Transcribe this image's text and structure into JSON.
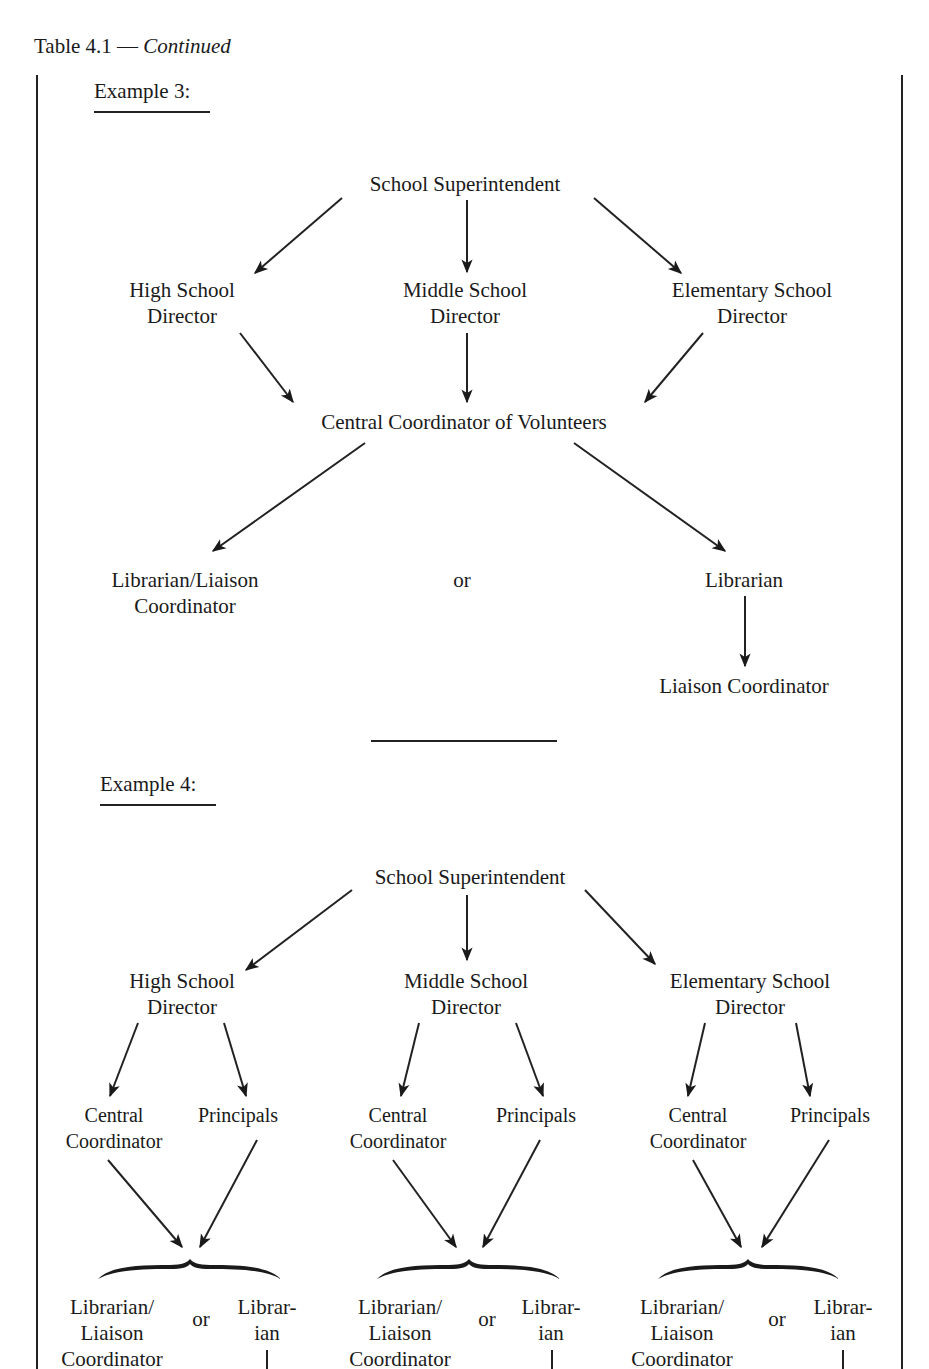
{
  "caption": {
    "prefix": "Table 4.1 — ",
    "italic": "Continued"
  },
  "example3": {
    "heading": "Example 3:",
    "superintendent": "School Superintendent",
    "directors": [
      {
        "line1": "High School",
        "line2": "Director"
      },
      {
        "line1": "Middle School",
        "line2": "Director"
      },
      {
        "line1": "Elementary School",
        "line2": "Director"
      }
    ],
    "central": "Central Coordinator of Volunteers",
    "option_a": {
      "line1": "Librarian/Liaison",
      "line2": "Coordinator"
    },
    "or": "or",
    "option_b": {
      "top": "Librarian",
      "bottom": "Liaison Coordinator"
    }
  },
  "example4": {
    "heading": "Example 4:",
    "superintendent": "School Superintendent",
    "branches": [
      {
        "director": {
          "line1": "High School",
          "line2": "Director"
        },
        "central": {
          "line1": "Central",
          "line2": "Coordinator"
        },
        "principals": "Principals",
        "option_a": {
          "line1": "Librarian/",
          "line2": "Liaison",
          "line3": "Coordinator"
        },
        "or": "or",
        "option_b": {
          "line1": "Librar-",
          "line2": "ian"
        }
      },
      {
        "director": {
          "line1": "Middle School",
          "line2": "Director"
        },
        "central": {
          "line1": "Central",
          "line2": "Coordinator"
        },
        "principals": "Principals",
        "option_a": {
          "line1": "Librarian/",
          "line2": "Liaison",
          "line3": "Coordinator"
        },
        "or": "or",
        "option_b": {
          "line1": "Librar-",
          "line2": "ian"
        }
      },
      {
        "director": {
          "line1": "Elementary School",
          "line2": "Director"
        },
        "central": {
          "line1": "Central",
          "line2": "Coordinator"
        },
        "principals": "Principals",
        "option_a": {
          "line1": "Librarian/",
          "line2": "Liaison",
          "line3": "Coordinator"
        },
        "or": "or",
        "option_b": {
          "line1": "Librar-",
          "line2": "ian"
        }
      }
    ]
  }
}
